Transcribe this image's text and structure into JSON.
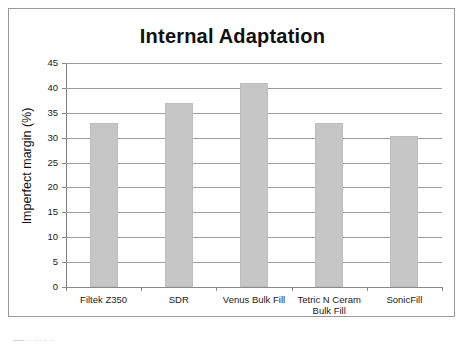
{
  "chart_data": {
    "type": "bar",
    "title": "Internal Adaptation",
    "xlabel": "",
    "ylabel": "Imperfect margin (%)",
    "categories": [
      "Filtek Z350",
      "SDR",
      "Venus Bulk Fill",
      "Tetric N Ceram Bulk Fill",
      "SonicFill"
    ],
    "category_lines": [
      [
        "Filtek Z350"
      ],
      [
        "SDR"
      ],
      [
        "Venus Bulk Fill"
      ],
      [
        "Tetric N Ceram",
        "Bulk Fill"
      ],
      [
        "SonicFill"
      ]
    ],
    "values": [
      33,
      37,
      41,
      33,
      30.3
    ],
    "ylim": [
      0,
      45
    ],
    "ytick_values": [
      0,
      5,
      10,
      15,
      20,
      25,
      30,
      35,
      40,
      45
    ],
    "ytick_labels": [
      "0",
      "5",
      "10",
      "15",
      "20",
      "25",
      "30",
      "35",
      "40",
      "45"
    ],
    "grid": true,
    "legend": "none",
    "bar_color": "#c6c6c6",
    "grid_color": "#9d9d9d",
    "axis_color": "#8a8a8a",
    "text_color": "#1a1a1a"
  },
  "artifacts": {
    "bottom_clipped_text": "──  ·· ···  ·  ··"
  }
}
